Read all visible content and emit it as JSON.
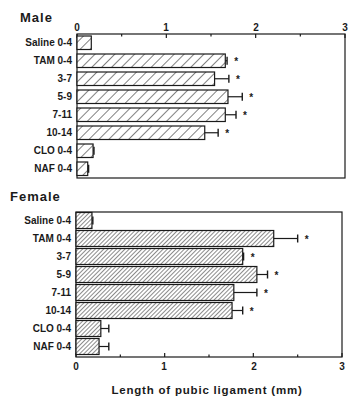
{
  "chart_data": [
    {
      "type": "bar",
      "orientation": "horizontal",
      "title": "Male",
      "xlabel": "",
      "ylabel": "",
      "xlim": [
        0,
        3
      ],
      "xticks": [
        "0",
        "1",
        "2",
        "3"
      ],
      "xaxis_position": "top",
      "categories": [
        "Saline 0-4",
        "TAM 0-4",
        "3-7",
        "5-9",
        "7-11",
        "10-14",
        "CLO 0-4",
        "NAF 0-4"
      ],
      "values": [
        0.16,
        1.66,
        1.54,
        1.69,
        1.66,
        1.43,
        0.18,
        0.12
      ],
      "error": [
        0.0,
        0.02,
        0.16,
        0.16,
        0.12,
        0.15,
        0.01,
        0.01
      ],
      "significant": [
        false,
        true,
        true,
        true,
        true,
        true,
        false,
        false
      ],
      "fill_pattern": "sparse diagonal hatch",
      "annotation": "*"
    },
    {
      "type": "bar",
      "orientation": "horizontal",
      "title": "Female",
      "xlabel": "Length of pubic ligament (mm)",
      "ylabel": "",
      "xlim": [
        0,
        3
      ],
      "xticks": [
        "0",
        "1",
        "2",
        "3"
      ],
      "xaxis_position": "bottom",
      "categories": [
        "Saline 0-4",
        "TAM 0-4",
        "3-7",
        "5-9",
        "7-11",
        "10-14",
        "CLO 0-4",
        "NAF 0-4"
      ],
      "values": [
        0.18,
        2.23,
        1.88,
        2.04,
        1.78,
        1.76,
        0.28,
        0.26
      ],
      "error": [
        0.01,
        0.27,
        0.01,
        0.12,
        0.26,
        0.12,
        0.09,
        0.11
      ],
      "significant": [
        false,
        true,
        true,
        true,
        true,
        true,
        false,
        false
      ],
      "fill_pattern": "dense diagonal hatch",
      "annotation": "*"
    }
  ],
  "panels": {
    "male": {
      "title": "Male",
      "ticks": [
        "0",
        "1",
        "2",
        "3"
      ],
      "labels": [
        "Saline 0-4",
        "TAM 0-4",
        "3-7",
        "5-9",
        "7-11",
        "10-14",
        "CLO 0-4",
        "NAF 0-4"
      ]
    },
    "female": {
      "title": "Female",
      "ticks": [
        "0",
        "1",
        "2",
        "3"
      ],
      "labels": [
        "Saline 0-4",
        "TAM 0-4",
        "3-7",
        "5-9",
        "7-11",
        "10-14",
        "CLO 0-4",
        "NAF 0-4"
      ]
    }
  },
  "axis_title": "Length of pubic ligament (mm)",
  "significance_marker": "*",
  "colors": {
    "ink": "#1a1a1a",
    "background": "#ffffff"
  }
}
